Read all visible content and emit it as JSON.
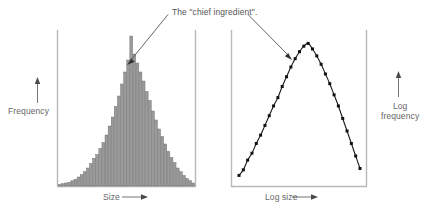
{
  "figure": {
    "annotation": "The \"chief ingredient\".",
    "background_color": "#ffffff",
    "axis_color": "#b8b8b8",
    "bar_fill_color": "#9a9a9a",
    "bar_edge_color": "#6e6e6e",
    "curve_color": "#1a1a1a",
    "marker_color": "#111111",
    "text_color": "#666666"
  },
  "left_panel": {
    "name": "histogram-panel",
    "y_axis_label": "Frequency",
    "x_axis_label": "Size",
    "x_axis_arrow": "right-arrow",
    "y_axis_arrow": "up-arrow"
  },
  "right_panel": {
    "name": "log-log-panel",
    "y_axis_label_line1": "Log",
    "y_axis_label_line2": "frequency",
    "x_axis_label": "Log size",
    "x_axis_arrow": "right-arrow",
    "y_axis_arrow": "up-arrow"
  },
  "chart_data": [
    {
      "type": "bar",
      "name": "size-frequency-histogram",
      "title": "",
      "xlabel": "Size",
      "ylabel": "Frequency",
      "grid": false,
      "legend": null,
      "xlim": [
        0,
        44
      ],
      "ylim": [
        0,
        100
      ],
      "categories": [
        "1",
        "2",
        "3",
        "4",
        "5",
        "6",
        "7",
        "8",
        "9",
        "10",
        "11",
        "12",
        "13",
        "14",
        "15",
        "16",
        "17",
        "18",
        "19",
        "20",
        "21",
        "22",
        "23",
        "24",
        "25",
        "26",
        "27",
        "28",
        "29",
        "30",
        "31",
        "32",
        "33",
        "34",
        "35",
        "36",
        "37",
        "38",
        "39",
        "40",
        "41",
        "42",
        "43",
        "44"
      ],
      "values": [
        1,
        1.5,
        2,
        2.5,
        3.5,
        4.5,
        6,
        7.5,
        9.5,
        12,
        15,
        18.5,
        21,
        25,
        29,
        34,
        40,
        46,
        53,
        60,
        68,
        76,
        84,
        100,
        88,
        82,
        76,
        70,
        63,
        57,
        50,
        44,
        38,
        33,
        28,
        23,
        19,
        15.5,
        12,
        9.5,
        7,
        5,
        3.5,
        2
      ]
    },
    {
      "type": "line",
      "name": "log-log-curve",
      "title": "",
      "xlabel": "Log size",
      "ylabel": "Log frequency",
      "grid": false,
      "legend": null,
      "markers": "filled-square",
      "xlim": [
        0,
        30
      ],
      "ylim": [
        0,
        100
      ],
      "x": [
        1,
        2,
        3,
        4,
        5,
        6,
        7,
        8,
        9,
        10,
        11,
        12,
        13,
        14,
        15,
        16,
        17,
        18,
        19,
        20,
        21,
        22,
        23,
        24,
        25,
        26,
        27,
        28,
        29
      ],
      "values": [
        4,
        8,
        15,
        20,
        27,
        33,
        40,
        47,
        54,
        60,
        68,
        75,
        82,
        88,
        93,
        97,
        99,
        95,
        90,
        84,
        77,
        70,
        62,
        54,
        45,
        36,
        27,
        18,
        9
      ]
    }
  ]
}
